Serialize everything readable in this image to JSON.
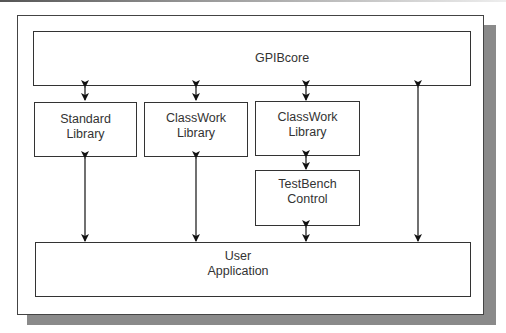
{
  "diagram": {
    "nodes": {
      "gpibcore": {
        "label": "GPIBcore"
      },
      "standard_library": {
        "line1": "Standard",
        "line2": "Library"
      },
      "classwork_library_1": {
        "line1": "ClassWork",
        "line2": "Library"
      },
      "classwork_library_2": {
        "line1": "ClassWork",
        "line2": "Library"
      },
      "testbench_control": {
        "line1": "TestBench",
        "line2": "Control"
      },
      "user_application": {
        "line1": "User",
        "line2": "Application"
      }
    },
    "edges": [
      {
        "from": "gpibcore",
        "to": "standard_library",
        "type": "bidirectional"
      },
      {
        "from": "gpibcore",
        "to": "classwork_library_1",
        "type": "bidirectional"
      },
      {
        "from": "gpibcore",
        "to": "classwork_library_2",
        "type": "bidirectional"
      },
      {
        "from": "standard_library",
        "to": "user_application",
        "type": "bidirectional"
      },
      {
        "from": "classwork_library_1",
        "to": "user_application",
        "type": "bidirectional"
      },
      {
        "from": "classwork_library_2",
        "to": "testbench_control",
        "type": "bidirectional"
      },
      {
        "from": "testbench_control",
        "to": "user_application",
        "type": "bidirectional"
      },
      {
        "from": "gpibcore",
        "to": "user_application",
        "type": "bidirectional"
      }
    ]
  }
}
